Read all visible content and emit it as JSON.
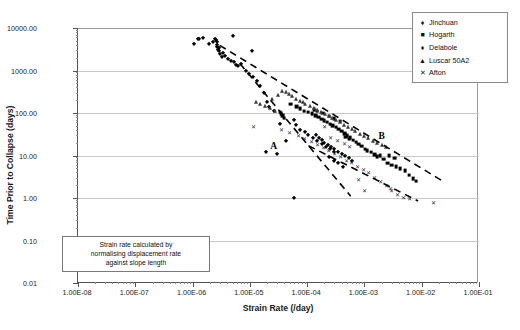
{
  "chart_data": {
    "type": "scatter",
    "title": "",
    "xlabel": "Strain Rate (/day)",
    "ylabel": "Time Prior to Collapse (days)",
    "xscale": "log",
    "yscale": "log",
    "xlim": [
      1e-08,
      0.1
    ],
    "ylim": [
      0.01,
      10000
    ],
    "xticklabels": [
      "1.00E-08",
      "1.00E-07",
      "1.00E-06",
      "1.00E-05",
      "1.00E-04",
      "1.00E-03",
      "1.00E-02",
      "1.00E-01"
    ],
    "yticklabels": [
      "10000.00",
      "1000.00",
      "100.00",
      "10.00",
      "1.00",
      "0.10",
      "0.01"
    ],
    "grid": "horizontal",
    "legend_position": "top-right",
    "annotations": [
      {
        "text": "A",
        "x": 2.6e-05,
        "y": 17
      },
      {
        "text": "B",
        "x": 0.002,
        "y": 28
      },
      {
        "text": "Strain rate calculated by normalising displacement rate against slope length",
        "x": 1.2e-07,
        "y": 0.055
      }
    ],
    "series": [
      {
        "name": "Jinchuan",
        "marker": "diamond",
        "points": [
          [
            1.05e-06,
            4200
          ],
          [
            1.25e-06,
            5400
          ],
          [
            1.32e-06,
            5600
          ],
          [
            1.55e-06,
            5900
          ],
          [
            1.9e-06,
            4300
          ],
          [
            2.3e-06,
            4600
          ],
          [
            2.5e-06,
            5500
          ],
          [
            2.6e-06,
            5200
          ],
          [
            2.65e-06,
            4800
          ],
          [
            2.7e-06,
            3900
          ],
          [
            2.72e-06,
            3500
          ],
          [
            2.78e-06,
            3100
          ],
          [
            2.85e-06,
            2900
          ],
          [
            2.9e-06,
            3300
          ],
          [
            3e-06,
            2500
          ],
          [
            3.2e-06,
            2100
          ],
          [
            3.4e-06,
            2600
          ],
          [
            3.7e-06,
            2200
          ],
          [
            4.1e-06,
            1900
          ],
          [
            4.6e-06,
            1700
          ],
          [
            5.2e-06,
            1600
          ],
          [
            5.8e-06,
            1350
          ],
          [
            6.3e-06,
            1250
          ],
          [
            7e-06,
            1450
          ],
          [
            5e-06,
            6500
          ],
          [
            8.5e-06,
            980
          ],
          [
            9.5e-06,
            820
          ],
          [
            1.15e-05,
            700
          ],
          [
            1.35e-05,
            560
          ],
          [
            1.5e-05,
            430
          ],
          [
            1.75e-05,
            300
          ],
          [
            2e-05,
            180
          ],
          [
            2.2e-05,
            140
          ],
          [
            1.1e-05,
            2800
          ],
          [
            2.6e-05,
            110
          ],
          [
            3.3e-05,
            55
          ],
          [
            4.2e-05,
            22
          ],
          [
            1.9e-05,
            12
          ],
          [
            3e-05,
            11
          ],
          [
            5.8e-05,
            70
          ],
          [
            6.5e-05,
            52
          ],
          [
            7.5e-05,
            40
          ],
          [
            9e-05,
            36
          ],
          [
            0.000105,
            30
          ],
          [
            0.000125,
            26
          ],
          [
            0.00015,
            22
          ],
          [
            0.00018,
            19
          ],
          [
            0.00021,
            16
          ],
          [
            0.00025,
            14
          ],
          [
            0.0003,
            12
          ],
          [
            6e-05,
            1.0
          ],
          [
            0.00024,
            9
          ],
          [
            0.00029,
            7.5
          ],
          [
            0.00035,
            6.5
          ],
          [
            0.00042,
            5.5
          ]
        ]
      },
      {
        "name": "Hogarth",
        "marker": "square",
        "points": [
          [
            3.6e-05,
            95
          ],
          [
            3.8e-05,
            88
          ],
          [
            4e-05,
            80
          ],
          [
            4.2e-05,
            70
          ],
          [
            5.5e-05,
            150
          ],
          [
            7e-05,
            130
          ],
          [
            8e-05,
            115
          ],
          [
            9.5e-05,
            100
          ],
          [
            0.00011,
            95
          ],
          [
            0.00013,
            88
          ],
          [
            0.00015,
            80
          ],
          [
            0.00017,
            72
          ],
          [
            0.00019,
            66
          ],
          [
            0.00021,
            60
          ],
          [
            0.00024,
            55
          ],
          [
            0.00027,
            50
          ],
          [
            0.0003,
            46
          ],
          [
            0.00034,
            42
          ],
          [
            0.00038,
            38
          ],
          [
            0.00043,
            34
          ],
          [
            0.00048,
            30
          ],
          [
            0.00054,
            27
          ],
          [
            0.0006,
            24
          ],
          [
            0.00068,
            21
          ],
          [
            0.00076,
            19
          ],
          [
            0.00085,
            17
          ],
          [
            0.00095,
            15
          ],
          [
            0.0011,
            13
          ],
          [
            0.0012,
            12
          ],
          [
            0.0014,
            11
          ],
          [
            0.0016,
            9.5
          ],
          [
            0.0018,
            8.5
          ],
          [
            0.002,
            9
          ],
          [
            0.0023,
            7.5
          ],
          [
            0.0027,
            6
          ],
          [
            0.0032,
            5.5
          ],
          [
            0.0038,
            5
          ],
          [
            0.0045,
            4.5
          ],
          [
            0.0055,
            4
          ],
          [
            0.0065,
            3.2
          ],
          [
            0.0075,
            2.6
          ],
          [
            0.0085,
            2.3
          ],
          [
            0.00014,
            110
          ],
          [
            0.00016,
            100
          ],
          [
            0.0002,
            90
          ],
          [
            0.00026,
            78
          ],
          [
            0.00032,
            68
          ],
          [
            0.0004,
            58
          ],
          [
            0.0005,
            25
          ],
          [
            0.00058,
            22
          ],
          [
            0.0029,
            9
          ],
          [
            0.0036,
            8
          ]
        ]
      },
      {
        "name": "Delabole",
        "marker": "diamond",
        "points": [
          [
            0.00014,
            30
          ],
          [
            0.00016,
            26
          ],
          [
            0.00018,
            23
          ],
          [
            0.0002,
            20
          ],
          [
            0.00023,
            18
          ],
          [
            0.00026,
            16
          ],
          [
            0.0003,
            14
          ],
          [
            0.00035,
            12
          ],
          [
            0.0004,
            11
          ],
          [
            0.00046,
            9.5
          ],
          [
            0.00053,
            8.5
          ],
          [
            0.0006,
            7.5
          ]
        ]
      },
      {
        "name": "Luscar 50A2",
        "marker": "triangle",
        "points": [
          [
            1.4e-05,
            160
          ],
          [
            1.6e-05,
            150
          ],
          [
            2e-05,
            130
          ],
          [
            2.4e-05,
            115
          ],
          [
            3e-05,
            100
          ],
          [
            2.6e-05,
            190
          ],
          [
            3.4e-05,
            240
          ],
          [
            4e-05,
            300
          ],
          [
            4.6e-05,
            280
          ],
          [
            5.2e-05,
            250
          ],
          [
            6e-05,
            220
          ],
          [
            7e-05,
            195
          ],
          [
            8e-05,
            175
          ],
          [
            9e-05,
            160
          ],
          [
            0.0001,
            145
          ],
          [
            0.00012,
            130
          ],
          [
            0.00014,
            118
          ],
          [
            0.00016,
            105
          ],
          [
            0.00019,
            95
          ],
          [
            0.00022,
            85
          ],
          [
            0.00026,
            75
          ],
          [
            0.0003,
            68
          ],
          [
            0.00035,
            60
          ],
          [
            0.0004,
            54
          ],
          [
            0.00048,
            48
          ],
          [
            0.00056,
            42
          ],
          [
            0.00065,
            38
          ],
          [
            0.00075,
            33
          ],
          [
            0.0009,
            29
          ],
          [
            0.00105,
            26
          ],
          [
            0.00125,
            23
          ],
          [
            0.0015,
            20
          ],
          [
            0.0018,
            18
          ],
          [
            0.0022,
            16
          ],
          [
            0.0026,
            14
          ]
        ]
      },
      {
        "name": "Afton",
        "marker": "x",
        "points": [
          [
            1.15e-05,
            48
          ],
          [
            3.5e-05,
            40
          ],
          [
            5e-05,
            33
          ],
          [
            7e-05,
            28
          ],
          [
            9e-05,
            24
          ],
          [
            0.00012,
            21
          ],
          [
            0.00015,
            18
          ],
          [
            0.00019,
            15
          ],
          [
            0.00024,
            13
          ],
          [
            0.0003,
            11
          ],
          [
            0.00038,
            9
          ],
          [
            0.00048,
            7.5
          ],
          [
            0.0006,
            6.5
          ],
          [
            0.00075,
            5.5
          ],
          [
            0.00095,
            4.5
          ],
          [
            0.0012,
            3.8
          ],
          [
            0.0015,
            3.0
          ],
          [
            0.0019,
            2.4
          ],
          [
            0.0024,
            1.9
          ],
          [
            0.003,
            1.5
          ],
          [
            0.0038,
            1.2
          ],
          [
            0.0048,
            1.0
          ],
          [
            0.006,
            0.95
          ],
          [
            0.016,
            0.75
          ],
          [
            0.00026,
            26
          ],
          [
            0.00034,
            22
          ],
          [
            0.00044,
            19
          ],
          [
            0.001,
            1.5
          ],
          [
            0.0029,
            1.6
          ],
          [
            0.00055,
            16
          ],
          [
            0.0008,
            2.6
          ],
          [
            0.0002,
            46
          ]
        ]
      }
    ],
    "envelope_lines": [
      {
        "name": "upper-envelope",
        "from": [
          3.1e-06,
          3900
        ],
        "to": [
          0.023,
          2.6
        ]
      },
      {
        "name": "lower-envelope",
        "from": [
          7e-06,
          1450
        ],
        "to": [
          0.0006,
          1.1
        ]
      },
      {
        "name": "lower-envelope-extension",
        "from": [
          0.00011,
          17
        ],
        "to": [
          0.009,
          0.85
        ]
      }
    ]
  },
  "legend": {
    "items": [
      {
        "label": "Jinchuan",
        "marker": "♦"
      },
      {
        "label": "Hogarth",
        "marker": "■"
      },
      {
        "label": "Delabole",
        "marker": "♦"
      },
      {
        "label": "Luscar 50A2",
        "marker": "▲"
      },
      {
        "label": "Afton",
        "marker": "✕"
      }
    ]
  },
  "note": {
    "line1": "Strain rate calculated by",
    "line2": "normalising displacement rate",
    "line3": "against slope length"
  },
  "labels": {
    "envelope_a": "A",
    "envelope_b": "B"
  },
  "colors": {
    "marker": "#000000",
    "grid": "#c8c8c8",
    "axis": "#555555",
    "background": "#ffffff"
  }
}
